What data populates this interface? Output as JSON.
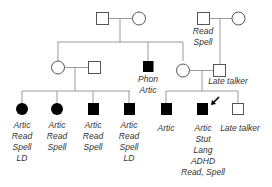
{
  "diagram": {
    "type": "pedigree",
    "colors": {
      "line": "#9a9a9a",
      "affected": "#000000",
      "unaffected": "#ffffff",
      "outline": "#555555",
      "text": "#333333"
    },
    "generation_1": {
      "left_couple": {
        "father": {
          "sex": "male",
          "affected": false,
          "labels": []
        },
        "mother": {
          "sex": "female",
          "affected": false,
          "labels": []
        }
      },
      "right_couple": {
        "father": {
          "sex": "male",
          "affected": false,
          "labels": [
            "Read",
            "Spell"
          ]
        },
        "mother": {
          "sex": "female",
          "affected": false,
          "labels": []
        }
      }
    },
    "generation_2": {
      "left_couple": {
        "mother": {
          "sex": "female",
          "affected": false,
          "labels": []
        },
        "father": {
          "sex": "male",
          "affected": false,
          "labels": []
        }
      },
      "middle_son": {
        "sex": "male",
        "affected": true,
        "labels": [
          "Phon",
          "Artic"
        ]
      },
      "right_couple": {
        "mother": {
          "sex": "female",
          "affected": false,
          "labels": []
        },
        "father": {
          "sex": "male",
          "affected": false,
          "labels": [
            "Late talker"
          ]
        }
      }
    },
    "generation_3": {
      "left_children": [
        {
          "sex": "female",
          "affected": true,
          "labels": [
            "Artic",
            "Read",
            "Spell",
            "LD"
          ]
        },
        {
          "sex": "female",
          "affected": true,
          "labels": [
            "Artic",
            "Read",
            "Spell"
          ]
        },
        {
          "sex": "male",
          "affected": true,
          "labels": [
            "Artic",
            "Read",
            "Spell"
          ]
        },
        {
          "sex": "male",
          "affected": true,
          "labels": [
            "Artic",
            "Read",
            "Spell",
            "LD"
          ]
        }
      ],
      "right_children": [
        {
          "sex": "male",
          "affected": true,
          "proband": false,
          "labels": [
            "Artic"
          ]
        },
        {
          "sex": "male",
          "affected": true,
          "proband": true,
          "labels": [
            "Artic",
            "Stut",
            "Lang",
            "ADHD",
            "Read, Spell"
          ]
        },
        {
          "sex": "male",
          "affected": false,
          "proband": false,
          "labels": [
            "Late talker"
          ]
        }
      ]
    },
    "proband_marker": "arrow"
  }
}
